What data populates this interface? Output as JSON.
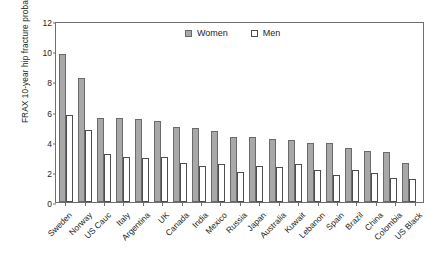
{
  "chart_data": {
    "type": "bar",
    "title": "",
    "xlabel": "",
    "ylabel": "FRAX 10-year hip fracture probability",
    "ylim": [
      0,
      12
    ],
    "yticks": [
      0,
      2,
      4,
      6,
      8,
      10,
      12
    ],
    "grid": false,
    "legend_position": "top-center",
    "categories": [
      "Sweden",
      "Norway",
      "US Cauc",
      "Italy",
      "Argentina",
      "UK",
      "Canada",
      "India",
      "Mexico",
      "Russia",
      "Japan",
      "Australia",
      "Kuwait",
      "Lebanon",
      "Spain",
      "Brazil",
      "China",
      "Colombia",
      "US Black"
    ],
    "series": [
      {
        "name": "Women",
        "color": "#a8a8a8",
        "values": [
          9.8,
          8.2,
          5.6,
          5.6,
          5.5,
          5.4,
          5.0,
          4.9,
          4.7,
          4.3,
          4.3,
          4.2,
          4.1,
          3.9,
          3.9,
          3.6,
          3.4,
          3.3,
          2.6
        ]
      },
      {
        "name": "Men",
        "color": "#ffffff",
        "values": [
          5.8,
          4.8,
          3.2,
          3.0,
          2.9,
          3.0,
          2.6,
          2.4,
          2.5,
          2.0,
          2.4,
          2.3,
          2.5,
          2.1,
          1.8,
          2.1,
          1.9,
          1.6,
          1.5
        ]
      }
    ]
  },
  "legend": {
    "items": [
      {
        "label": "Women",
        "marker": "filled-square-icon"
      },
      {
        "label": "Men",
        "marker": "open-square-icon"
      }
    ]
  }
}
